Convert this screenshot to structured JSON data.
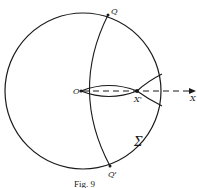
{
  "figure": {
    "caption": "Fig. 9",
    "colors": {
      "ink": "#1a1a1a",
      "background": "#ffffff"
    },
    "labels": {
      "Q": "Q",
      "Q_prime": "Q'",
      "O": "O",
      "X_prime": "X'",
      "X": "X",
      "Sigma": "Σ"
    },
    "elements": {
      "outer_circle": "sphere boundary",
      "arc_QQ": "great arc through Q, O, Q'",
      "lens": "two caustic arcs from O to X'",
      "dashed_axis": "dashed ray from O through X' to X (arrow)",
      "cusp_lines": "two lines diverging from X' beyond circle"
    }
  }
}
